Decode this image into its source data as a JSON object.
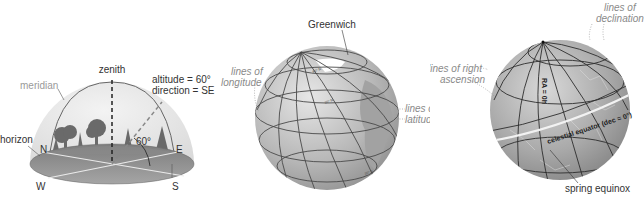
{
  "panels": [
    {
      "id": "horizon-system",
      "labels": {
        "zenith": "zenith",
        "meridian": "meridian",
        "altitude": "altitude = 60°",
        "direction": "direction = SE",
        "horizon": "horizon",
        "angle": "60°",
        "north": "N",
        "east": "E",
        "south": "S",
        "west": "W"
      }
    },
    {
      "id": "terrestrial-globe",
      "labels": {
        "greenwich": "Greenwich",
        "longitude_1": "lines of",
        "longitude_2": "longitude",
        "latitude_1": "lines of",
        "latitude_2": "latitude"
      }
    },
    {
      "id": "celestial-sphere",
      "labels": {
        "declination_1": "lines of",
        "declination_2": "declination",
        "ra_1": "lines of right",
        "ra_2": "ascension",
        "ra_zero": "RA = 0h",
        "celestial_equator": "celestial equator (dec = 0°)",
        "spring_equinox": "spring equinox"
      }
    }
  ],
  "colors": {
    "dome": "#e4e4e4",
    "ground": "#8f8f8f",
    "globe": "#b8b8b8",
    "celestial": "#a9a9a9",
    "line": "#3a3a3a"
  }
}
